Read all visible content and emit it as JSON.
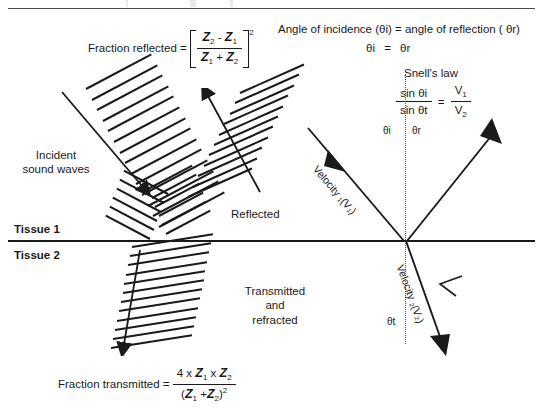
{
  "figure": {
    "title_hidden_header": "",
    "reflection_formula": {
      "label": "Fraction reflected  =",
      "numerator_z2": "Z",
      "numerator_z2_sub": "2",
      "minus": "-",
      "numerator_z1": "Z",
      "numerator_z1_sub": "1",
      "denominator_z1": "Z",
      "denominator_z1_sub": "1",
      "plus": "+",
      "denominator_z2": "Z",
      "denominator_z2_sub": "2",
      "exponent": "2"
    },
    "transmission_formula": {
      "label": "Fraction transmitted  =",
      "num_four": "4 x",
      "num_z1": "Z",
      "num_z1_sub": "1",
      "num_times": "x",
      "num_z2": "Z",
      "num_z2_sub": "2",
      "den_open": "(",
      "den_z1": "Z",
      "den_z1_sub": "1",
      "den_plus": "+",
      "den_z2": "Z",
      "den_z2_sub": "2",
      "den_close": ")",
      "den_exponent": "2"
    },
    "angle_law": {
      "line1": "Angle of incidence  (θi)  =  angle of reflection ( θr)",
      "line2_left": "θi",
      "line2_equals": "=",
      "line2_right": "θr"
    },
    "snells_law": {
      "title": "Snell's law",
      "num_left": "sin θi",
      "den_left": "sin θt",
      "equals": "=",
      "num_right": "V",
      "num_right_sub": "1",
      "den_right": "V",
      "den_right_sub": "2"
    },
    "labels": {
      "incident_line1": "Incident",
      "incident_line2": "sound waves",
      "tissue1": "Tissue 1",
      "tissue2": "Tissue 2",
      "reflected": "Reflected",
      "transmitted_line1": "Transmitted",
      "transmitted_line2": "and",
      "transmitted_line3": "refracted",
      "theta_i": "θi",
      "theta_r": "θr",
      "theta_t": "θt",
      "velocity1": "Velocity ₁(V₁)",
      "velocity2": "Velocity ₂(V₂)"
    },
    "colors": {
      "ink": "#1a1a1a",
      "rule": "#4a4a4a",
      "normal_dotted": "#555555",
      "background": "#ffffff"
    }
  }
}
